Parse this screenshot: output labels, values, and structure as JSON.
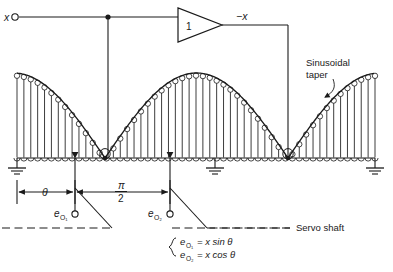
{
  "figure": {
    "type": "circuit-schematic",
    "line_color": "#1a1a1a",
    "background": "#ffffff"
  },
  "labels": {
    "input": "x",
    "amplifier_gain": "1",
    "amplifier_output": "−x",
    "taper_line1": "Sinusoidal",
    "taper_line2": "taper",
    "angle": "θ",
    "quarter_pi_num": "π",
    "quarter_pi_den": "2",
    "output1": "e",
    "output1_sub": "O₁",
    "output2": "e",
    "output2_sub": "O₂",
    "servo_shaft": "Servo shaft",
    "equation1_lhs": "e",
    "equation1_lhs_sub": "O₁",
    "equation1_rhs": "= x sin θ",
    "equation2_lhs": "e",
    "equation2_lhs_sub": "O₂",
    "equation2_rhs": "= x cos θ"
  },
  "geometry": {
    "winding_x_start": 17,
    "winding_x_end": 375,
    "winding_baseline_y": 158,
    "winding_peak_y": 73,
    "valley_x_1": 105,
    "valley_x_2": 288,
    "turn_count": 52,
    "ground_positions_x": [
      17,
      215,
      375
    ],
    "wiper1_x": 75,
    "wiper2_x": 170,
    "input_terminal_x": 14,
    "input_terminal_y": 17,
    "junction_x": 108,
    "amp_left_x": 178,
    "amp_right_x": 222,
    "amp_center_y": 25,
    "return_wire_x": 288,
    "servo_shaft_y": 228,
    "dim_line_y": 192
  },
  "chart_data": {
    "type": "line",
    "xlabel": "shaft angle",
    "ylabel": "turns density",
    "x": [
      17,
      39,
      61,
      83,
      105,
      127,
      150,
      173,
      196,
      219,
      242,
      265,
      288,
      310,
      332,
      354,
      375
    ],
    "values": [
      85,
      79,
      62,
      36,
      0,
      36,
      62,
      79,
      85,
      79,
      62,
      36,
      0,
      36,
      62,
      79,
      85
    ],
    "annotations": [
      "Sinusoidal taper"
    ],
    "grid": false
  }
}
